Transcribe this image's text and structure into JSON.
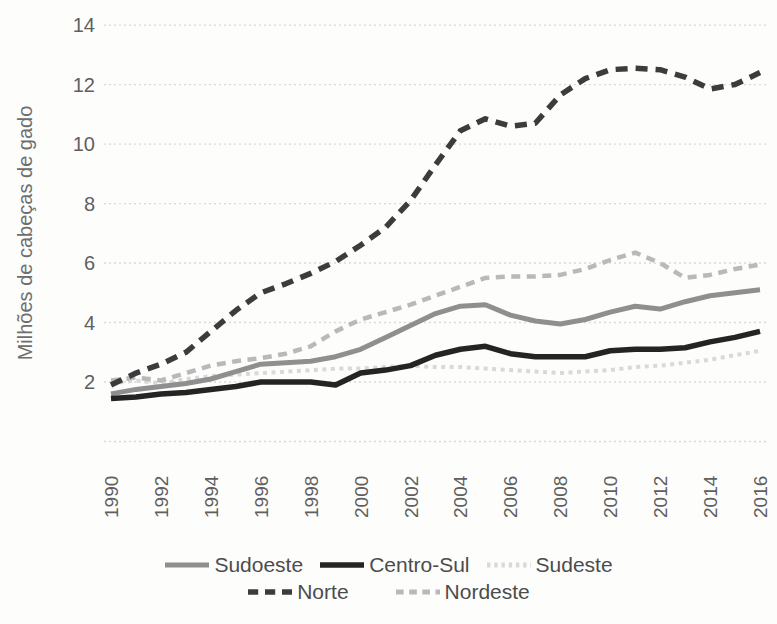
{
  "figure": {
    "background": "#fdfdfc"
  },
  "chart_data": {
    "type": "line",
    "title": "",
    "xlabel": "",
    "ylabel": "Milhões de cabeças de gado",
    "unit": "milhões de cabeças de gado",
    "x": [
      1990,
      1991,
      1992,
      1993,
      1994,
      1995,
      1996,
      1997,
      1998,
      1999,
      2000,
      2001,
      2002,
      2003,
      2004,
      2005,
      2006,
      2007,
      2008,
      2009,
      2010,
      2011,
      2012,
      2013,
      2014,
      2015,
      2016
    ],
    "x_tick_labels": [
      "1990",
      "1992",
      "1994",
      "1996",
      "1998",
      "2000",
      "2002",
      "2004",
      "2006",
      "2008",
      "2010",
      "2012",
      "2014",
      "2016"
    ],
    "y_ticks": [
      2,
      4,
      6,
      8,
      10,
      12,
      14
    ],
    "y_tick_labels": [
      "2",
      "4",
      "6",
      "8",
      "10",
      "12",
      "14"
    ],
    "ylim": [
      0,
      14
    ],
    "grid": "horizontal-dotted",
    "legend_position": "bottom",
    "series": [
      {
        "name": "Sudeste",
        "color": "#d9d9d9",
        "style": "dotted",
        "dash": [
          4,
          4.5
        ],
        "width": 4,
        "values": [
          1.95,
          2.05,
          1.95,
          2.1,
          2.2,
          2.25,
          2.3,
          2.35,
          2.4,
          2.45,
          2.45,
          2.5,
          2.55,
          2.5,
          2.5,
          2.45,
          2.4,
          2.35,
          2.3,
          2.35,
          2.4,
          2.5,
          2.55,
          2.65,
          2.75,
          2.9,
          3.05
        ]
      },
      {
        "name": "Nordeste",
        "color": "#b9b9b9",
        "style": "dashed",
        "dash": [
          9,
          6.5
        ],
        "width": 4.5,
        "values": [
          2.05,
          2.15,
          2.05,
          2.3,
          2.55,
          2.7,
          2.8,
          2.95,
          3.2,
          3.7,
          4.1,
          4.35,
          4.6,
          4.9,
          5.2,
          5.5,
          5.55,
          5.55,
          5.6,
          5.8,
          6.1,
          6.35,
          6.0,
          5.5,
          5.6,
          5.8,
          5.95
        ]
      },
      {
        "name": "Sudoeste",
        "color": "#8f8f8f",
        "style": "solid",
        "dash": null,
        "width": 5,
        "values": [
          1.6,
          1.75,
          1.85,
          1.95,
          2.1,
          2.35,
          2.6,
          2.65,
          2.7,
          2.85,
          3.1,
          3.5,
          3.9,
          4.3,
          4.55,
          4.6,
          4.25,
          4.05,
          3.95,
          4.1,
          4.35,
          4.55,
          4.45,
          4.7,
          4.9,
          5.0,
          5.1
        ]
      },
      {
        "name": "Centro-Sul",
        "color": "#242424",
        "style": "solid",
        "dash": null,
        "width": 5.5,
        "values": [
          1.45,
          1.5,
          1.6,
          1.65,
          1.75,
          1.85,
          2.0,
          2.0,
          2.0,
          1.9,
          2.3,
          2.4,
          2.55,
          2.9,
          3.1,
          3.2,
          2.95,
          2.85,
          2.85,
          2.85,
          3.05,
          3.1,
          3.1,
          3.15,
          3.35,
          3.5,
          3.7
        ]
      },
      {
        "name": "Norte",
        "color": "#3c3c3c",
        "style": "dashed",
        "dash": [
          12,
          8
        ],
        "width": 5.5,
        "values": [
          1.9,
          2.3,
          2.6,
          3.0,
          3.7,
          4.4,
          5.0,
          5.3,
          5.65,
          6.05,
          6.6,
          7.2,
          8.1,
          9.3,
          10.45,
          10.85,
          10.6,
          10.7,
          11.65,
          12.2,
          12.5,
          12.55,
          12.5,
          12.25,
          11.85,
          12.0,
          12.4
        ]
      }
    ],
    "legend_rows": [
      [
        "Sudoeste",
        "Centro-Sul",
        "Sudeste"
      ],
      [
        "Norte",
        "Nordeste"
      ]
    ]
  },
  "colors": {
    "gridline": "#d9d9d9",
    "tick_text": "#5f5f5f",
    "axis_title_text": "#6e6e6e",
    "legend_text": "#4c4c4c"
  }
}
